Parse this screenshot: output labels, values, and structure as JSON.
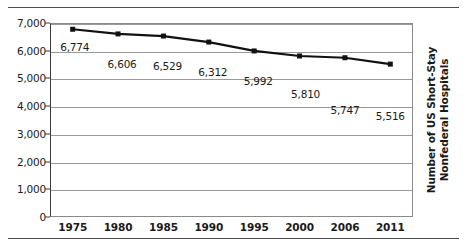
{
  "chart_data": {
    "type": "line",
    "title": "",
    "xlabel": "",
    "ylabel": "Number of US Short-Stay Nonfederal Hospitals",
    "ylabel_lines": [
      "Number of US Short-Stay",
      "Nonfederal Hospitals"
    ],
    "categories": [
      "1975",
      "1980",
      "1985",
      "1990",
      "1995",
      "2000",
      "2006",
      "2011"
    ],
    "values": [
      6774,
      6606,
      6529,
      6312,
      5992,
      5810,
      5747,
      5516
    ],
    "point_labels": [
      "6,774",
      "6,606",
      "6,529",
      "6,312",
      "5,992",
      "5,810",
      "5,747",
      "5,516"
    ],
    "ylim": [
      0,
      7000
    ],
    "yticks": [
      0,
      1000,
      2000,
      3000,
      4000,
      5000,
      6000,
      7000
    ],
    "ytick_labels": [
      "0",
      "1,000",
      "2,000",
      "3,000",
      "4,000",
      "5,000",
      "6,000",
      "7,000"
    ],
    "grid": true,
    "legend": "none",
    "series_color": "#111111",
    "gridline_color": "#9a9a9a",
    "axis_color": "#3a3a3a",
    "background_color": "#ffffff"
  }
}
